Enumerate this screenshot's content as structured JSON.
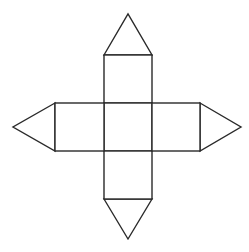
{
  "diagram": {
    "stroke_color": "#2a2a2a",
    "fill_color": "#ffffff",
    "stroke_width": 1.4,
    "shapes": {
      "top_triangle": {
        "points": "104,55 128,14 152,55"
      },
      "bottom_triangle": {
        "points": "104,199 128,239 152,199"
      },
      "left_triangle": {
        "points": "55,103 13,127 55,151"
      },
      "right_triangle": {
        "points": "200,103 241,127 200,151"
      },
      "top_rect": {
        "x": 104,
        "y": 55,
        "w": 48,
        "h": 48
      },
      "center_rect": {
        "x": 104,
        "y": 103,
        "w": 48,
        "h": 48
      },
      "bottom_rect": {
        "x": 104,
        "y": 151,
        "w": 48,
        "h": 48
      },
      "left_rect": {
        "x": 55,
        "y": 103,
        "w": 49,
        "h": 48
      },
      "right_rect": {
        "x": 152,
        "y": 103,
        "w": 48,
        "h": 48
      }
    }
  }
}
